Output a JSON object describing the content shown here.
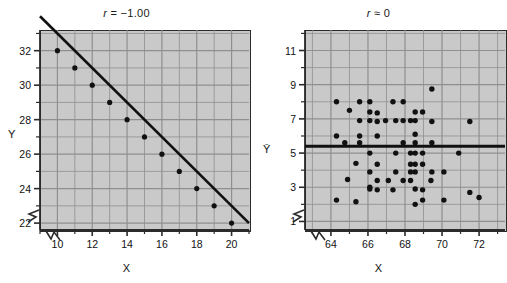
{
  "figure": {
    "background": "#ffffff",
    "plot_area_fill": "#c9c9c9",
    "grid_color": "#8f8f8f",
    "axis_color": "#2b2b2b",
    "data_color": "#111111"
  },
  "panels": [
    {
      "id": "left",
      "title_prefix": "r",
      "title_rest": " = −1.00",
      "title_full": "r = −1.00",
      "xlabel": "X",
      "ylabel": "Y",
      "axis_break": true,
      "xlim": [
        9,
        21
      ],
      "ylim": [
        21.6,
        33.2
      ],
      "xticks": [
        10,
        12,
        14,
        16,
        18,
        20
      ],
      "xtick_labels": [
        "10",
        "12",
        "14",
        "16",
        "18",
        "20"
      ],
      "xminor": [
        9,
        11,
        13,
        15,
        17,
        19,
        21
      ],
      "yticks": [
        22,
        24,
        26,
        28,
        30,
        32
      ],
      "ytick_labels": [
        "22",
        "24",
        "26",
        "28",
        "30",
        "32"
      ],
      "yminor": [
        23,
        25,
        27,
        29,
        31,
        33
      ]
    },
    {
      "id": "right",
      "title_prefix": "r",
      "title_rest": " ≈ 0",
      "title_full": "r ≈ 0",
      "xlabel": "X",
      "ylabel": "Ȳ",
      "axis_break": true,
      "xlim": [
        62.6,
        73.4
      ],
      "ylim": [
        0.5,
        12.2
      ],
      "xticks": [
        64,
        66,
        68,
        70,
        72
      ],
      "xtick_labels": [
        "64",
        "66",
        "68",
        "70",
        "72"
      ],
      "xminor": [
        63,
        65,
        67,
        69,
        71,
        73
      ],
      "yticks": [
        1,
        3,
        5,
        7,
        9,
        11
      ],
      "ytick_labels": [
        "1",
        "3",
        "5",
        "7",
        "9",
        "11"
      ],
      "yminor": [
        2,
        4,
        6,
        8,
        10,
        12
      ]
    }
  ],
  "chart_data": [
    {
      "type": "line",
      "title": "r = −1.00",
      "xlabel": "X",
      "ylabel": "Y",
      "xlim": [
        9,
        21
      ],
      "ylim": [
        21.6,
        33.2
      ],
      "grid": true,
      "legend": "none",
      "correlation": -1.0,
      "line": {
        "intercept": 43,
        "slope": -1,
        "from_x": 9,
        "to_x": 21
      },
      "x": [
        10,
        11,
        12,
        13,
        14,
        15,
        16,
        17,
        18,
        19,
        20
      ],
      "y": [
        32,
        31,
        30,
        29,
        28,
        27,
        26,
        25,
        24,
        23,
        22
      ],
      "marker": "filled-circle"
    },
    {
      "type": "scatter",
      "title": "r ≈ 0",
      "xlabel": "X",
      "ylabel": "Ȳ",
      "xlim": [
        62.6,
        73.4
      ],
      "ylim": [
        0.5,
        12.2
      ],
      "grid": true,
      "legend": "none",
      "correlation": 0.0,
      "mean_line_y": 5.4,
      "points": [
        [
          69.45,
          8.75
        ],
        [
          64.3,
          8.0
        ],
        [
          65.55,
          8.0
        ],
        [
          66.1,
          8.0
        ],
        [
          67.35,
          8.0
        ],
        [
          67.9,
          8.0
        ],
        [
          65.0,
          7.5
        ],
        [
          66.1,
          7.4
        ],
        [
          66.5,
          7.35
        ],
        [
          68.55,
          7.4
        ],
        [
          68.95,
          7.4
        ],
        [
          65.55,
          6.9
        ],
        [
          66.1,
          6.9
        ],
        [
          66.5,
          6.85
        ],
        [
          66.95,
          6.9
        ],
        [
          67.5,
          6.9
        ],
        [
          67.9,
          6.9
        ],
        [
          68.3,
          6.9
        ],
        [
          68.55,
          6.9
        ],
        [
          69.45,
          6.85
        ],
        [
          71.5,
          6.85
        ],
        [
          64.3,
          6.0
        ],
        [
          65.55,
          6.0
        ],
        [
          66.5,
          6.0
        ],
        [
          68.55,
          6.1
        ],
        [
          64.75,
          5.6
        ],
        [
          65.55,
          5.6
        ],
        [
          67.9,
          5.6
        ],
        [
          68.55,
          5.6
        ],
        [
          69.45,
          5.6
        ],
        [
          66.1,
          5.0
        ],
        [
          67.5,
          5.0
        ],
        [
          68.3,
          5.0
        ],
        [
          68.55,
          5.0
        ],
        [
          68.95,
          5.0
        ],
        [
          70.9,
          5.0
        ],
        [
          65.35,
          4.4
        ],
        [
          66.5,
          4.35
        ],
        [
          68.3,
          4.35
        ],
        [
          68.55,
          4.35
        ],
        [
          68.95,
          4.35
        ],
        [
          66.1,
          3.9
        ],
        [
          67.5,
          3.9
        ],
        [
          68.3,
          3.9
        ],
        [
          68.55,
          3.9
        ],
        [
          69.45,
          3.9
        ],
        [
          70.1,
          3.9
        ],
        [
          64.9,
          3.45
        ],
        [
          66.5,
          3.4
        ],
        [
          67.1,
          3.4
        ],
        [
          67.9,
          3.4
        ],
        [
          68.3,
          3.4
        ],
        [
          69.4,
          3.4
        ],
        [
          66.1,
          3.0
        ],
        [
          66.1,
          2.9
        ],
        [
          66.5,
          2.85
        ],
        [
          67.35,
          2.85
        ],
        [
          68.55,
          2.9
        ],
        [
          68.95,
          2.85
        ],
        [
          71.5,
          2.7
        ],
        [
          64.3,
          2.25
        ],
        [
          65.35,
          2.15
        ],
        [
          68.55,
          2.0
        ],
        [
          68.95,
          2.25
        ],
        [
          70.1,
          2.25
        ],
        [
          72.0,
          2.4
        ]
      ],
      "marker": "filled-circle",
      "n_points": 67
    }
  ]
}
